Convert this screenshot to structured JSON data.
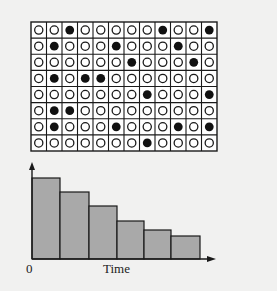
{
  "grid": {
    "rows": 8,
    "cols": 12,
    "cells": [
      [
        0,
        0,
        1,
        0,
        0,
        0,
        0,
        0,
        1,
        0,
        0,
        1
      ],
      [
        0,
        1,
        0,
        0,
        0,
        1,
        0,
        0,
        0,
        1,
        0,
        0
      ],
      [
        0,
        0,
        0,
        0,
        0,
        0,
        1,
        0,
        0,
        0,
        1,
        0
      ],
      [
        0,
        1,
        0,
        1,
        1,
        0,
        0,
        0,
        0,
        0,
        0,
        0
      ],
      [
        0,
        0,
        0,
        0,
        0,
        0,
        0,
        1,
        0,
        0,
        0,
        1
      ],
      [
        0,
        1,
        1,
        0,
        0,
        0,
        0,
        0,
        0,
        0,
        0,
        0
      ],
      [
        0,
        1,
        0,
        0,
        0,
        1,
        0,
        0,
        0,
        1,
        0,
        1
      ],
      [
        0,
        0,
        0,
        0,
        0,
        0,
        0,
        1,
        0,
        0,
        0,
        0
      ]
    ],
    "legend": {
      "filled": "filled-circle",
      "empty": "open-circle"
    }
  },
  "chart": {
    "x_origin_label": "0",
    "x_axis_label": "Time",
    "bar_fill": "#a9a9a9",
    "line_color": "#1a1a1a",
    "background": "#f1f1f0"
  },
  "chart_data": {
    "type": "bar",
    "title": "",
    "xlabel": "Time",
    "ylabel": "",
    "categories": [
      "1",
      "2",
      "3",
      "4",
      "5",
      "6"
    ],
    "values": [
      81,
      67,
      53,
      38,
      29,
      23
    ],
    "ylim": [
      0,
      96
    ],
    "grid": false,
    "legend": null,
    "annotations": [
      "0"
    ]
  }
}
